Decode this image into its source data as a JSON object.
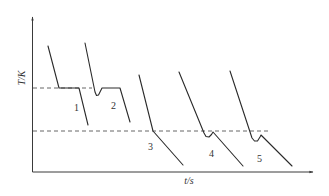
{
  "diagram": {
    "type": "cooling-curves",
    "y_axis_label": "T/K",
    "x_axis_label": "t/s",
    "reference_lines": [
      {
        "name": "upper-dashed-line",
        "y": 88,
        "x1": 33,
        "x2": 92
      },
      {
        "name": "lower-dashed-line",
        "y": 131,
        "x1": 33,
        "x2": 271
      }
    ],
    "curves": [
      {
        "label": "1",
        "points": "48,46 59,88 79,88 88,125",
        "label_x": 74,
        "label_y": 111
      },
      {
        "label": "2",
        "points": "85,43 95,92 96.5,95.5 98.5,95 102,88 120,88 130,122",
        "label_x": 111,
        "label_y": 109
      },
      {
        "label": "3",
        "points": "139,75 153,131 183,165",
        "label_x": 148,
        "label_y": 150
      },
      {
        "label": "4",
        "points": "179,72 204,133 206,136.5 209,137 211.5,134.5 213,132 243,166",
        "label_x": 209,
        "label_y": 157
      },
      {
        "label": "5",
        "points": "230,71 252,138 254.5,141 257.5,141 260,137 261,135 292,166",
        "label_x": 257,
        "label_y": 162
      }
    ],
    "colors": {
      "line": "#2a2a2a",
      "axis": "#3a3a3a",
      "dashed": "#555555",
      "background": "#ffffff"
    }
  }
}
